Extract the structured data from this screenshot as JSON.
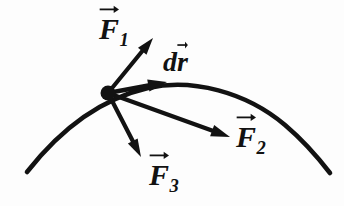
{
  "figure": {
    "type": "physics-vector-diagram",
    "background_color": "#fdfdfd",
    "ink_color": "#121212"
  },
  "curve": {
    "name": "trajectory-path",
    "left_end": [
      27,
      172
    ],
    "apex": [
      222,
      88
    ],
    "right_end": [
      330,
      173
    ],
    "stroke_width": 4.6
  },
  "origin_point": {
    "name": "particle-dot",
    "x": 108,
    "y": 93,
    "radius": 7.5
  },
  "vectors": [
    {
      "id": "F1",
      "label": "F",
      "subscript": "1",
      "has_overarrow": true,
      "from": [
        108,
        93
      ],
      "to": [
        153,
        38
      ],
      "stroke_width": 4.2,
      "head_length": 17,
      "head_width": 11
    },
    {
      "id": "dr",
      "label": "dr",
      "prefix": "d",
      "base": "r",
      "subscript": "",
      "has_overarrow": true,
      "from": [
        108,
        93
      ],
      "to": [
        167,
        82
      ],
      "stroke_width": 4.6,
      "head_length": 19,
      "head_width": 12
    },
    {
      "id": "F2",
      "label": "F",
      "subscript": "2",
      "has_overarrow": true,
      "from": [
        108,
        93
      ],
      "to": [
        230,
        137
      ],
      "stroke_width": 4.4,
      "head_length": 19,
      "head_width": 12
    },
    {
      "id": "F3",
      "label": "F",
      "subscript": "3",
      "has_overarrow": true,
      "from": [
        108,
        93
      ],
      "to": [
        141,
        157
      ],
      "stroke_width": 4.2,
      "head_length": 18,
      "head_width": 11
    }
  ],
  "labels": {
    "F1": {
      "base": "F",
      "sub": "1"
    },
    "dr": {
      "d": "d",
      "r": "r"
    },
    "F2": {
      "base": "F",
      "sub": "2"
    },
    "F3": {
      "base": "F",
      "sub": "3"
    }
  }
}
